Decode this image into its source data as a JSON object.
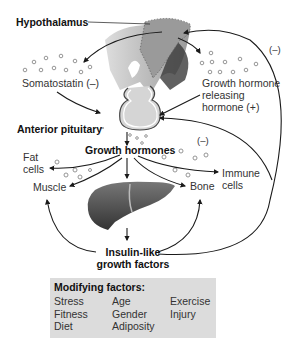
{
  "labels": {
    "hypothalamus": "Hypothalamus",
    "somatostatin": "Somatostatin (–)",
    "ghrh_line1": "Growth hormone",
    "ghrh_line2": "releasing",
    "ghrh_line3": "hormone (+)",
    "anterior_pituitary": "Anterior pituitary",
    "growth_hormones": "Growth hormones",
    "fat_cells_line1": "Fat",
    "fat_cells_line2": "cells",
    "muscle": "Muscle",
    "bone": "Bone",
    "immune_line1": "Immune",
    "immune_line2": "cells",
    "igf_line1": "Insulin-like",
    "igf_line2": "growth factors",
    "neg_feedback_outer": "(–)",
    "neg_feedback_inner": "(–)"
  },
  "modifying_factors": {
    "title": "Modifying factors:",
    "columns": [
      [
        "Stress",
        "Fitness",
        "Diet"
      ],
      [
        "Age",
        "Gender",
        "Adiposity"
      ],
      [
        "Exercise",
        "Injury"
      ]
    ]
  },
  "colors": {
    "box_bg": "#dcdcdc",
    "arrow": "#1a1a1a",
    "hypothalamus_fill": "#9a9a9a",
    "liver_fill": "#555555",
    "dots": "#8a8a8a"
  }
}
